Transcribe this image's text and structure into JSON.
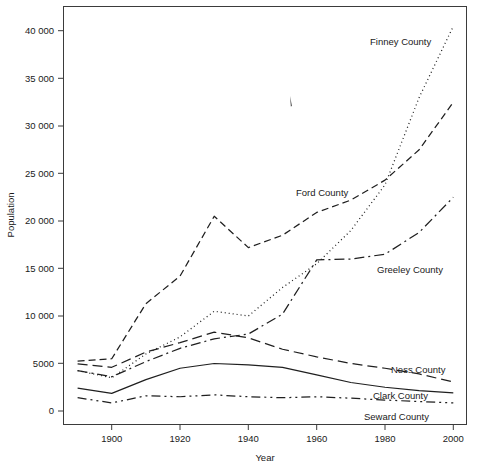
{
  "chart_data": {
    "type": "line",
    "title": "",
    "xlabel": "Year",
    "ylabel": "Population",
    "xlim": [
      1890,
      2000
    ],
    "ylim": [
      0,
      42000
    ],
    "grid": false,
    "legend_position": "inline-right-labels",
    "x": [
      1890,
      1900,
      1910,
      1920,
      1930,
      1940,
      1950,
      1960,
      1970,
      1980,
      1990,
      2000
    ],
    "xticks": [
      1900,
      1920,
      1940,
      1960,
      1980,
      2000
    ],
    "xtick_labels": [
      "1900",
      "1920",
      "1940",
      "1960",
      "1980",
      "2000"
    ],
    "yticks": [
      0,
      5000,
      10000,
      15000,
      20000,
      25000,
      30000,
      35000,
      40000
    ],
    "ytick_labels": [
      "0",
      "5000",
      "10 000",
      "15 000",
      "20 000",
      "25 000",
      "30 000",
      "35 000",
      "40 000"
    ],
    "series": [
      {
        "name": "Finney County",
        "label": "Finney County",
        "linestyle": "dotted",
        "values": [
          4250,
          3500,
          6000,
          7800,
          10500,
          10000,
          13000,
          15500,
          19000,
          23800,
          33000,
          40500
        ]
      },
      {
        "name": "Ford County",
        "label": "Ford County",
        "linestyle": "dashed",
        "values": [
          5250,
          5500,
          11300,
          14200,
          20500,
          17200,
          18500,
          20900,
          22200,
          24300,
          27500,
          32500
        ]
      },
      {
        "name": "Greeley County",
        "label": "Greeley County",
        "linestyle": "dash-dot",
        "values": [
          4250,
          3600,
          5200,
          6600,
          7600,
          8100,
          10200,
          15900,
          16000,
          16500,
          18800,
          22500
        ]
      },
      {
        "name": "Ness County",
        "label": "Ness County",
        "linestyle": "long-dashed",
        "values": [
          4950,
          4600,
          6200,
          7200,
          8300,
          7700,
          6500,
          5700,
          5000,
          4500,
          3900,
          3050
        ]
      },
      {
        "name": "Clark County",
        "label": "Clark County",
        "linestyle": "solid",
        "values": [
          2400,
          1850,
          3300,
          4500,
          5000,
          4850,
          4600,
          3800,
          3000,
          2500,
          2150,
          1900
        ]
      },
      {
        "name": "Seward County",
        "label": "Seward County",
        "linestyle": "dash-dot-dot",
        "values": [
          1400,
          850,
          1600,
          1500,
          1700,
          1500,
          1400,
          1500,
          1350,
          1150,
          1000,
          850
        ]
      }
    ]
  },
  "axes": {
    "ylabel": "Population",
    "xlabel": "Year"
  },
  "labels": {
    "finney": "Finney County",
    "ford": "Ford County",
    "greeley": "Greeley County",
    "ness": "Ness County",
    "clark": "Clark County",
    "seward": "Seward County"
  },
  "ytick_text": {
    "t0": "0",
    "t1": "5000",
    "t2": "10 000",
    "t3": "15 000",
    "t4": "20 000",
    "t5": "25 000",
    "t6": "30 000",
    "t7": "35 000",
    "t8": "40 000"
  },
  "xtick_text": {
    "t0": "1900",
    "t1": "1920",
    "t2": "1940",
    "t3": "1960",
    "t4": "1980",
    "t5": "2000"
  },
  "colors": {
    "ink": "#1f1f1f",
    "frame": "#3b3b3b",
    "background": "#ffffff"
  }
}
